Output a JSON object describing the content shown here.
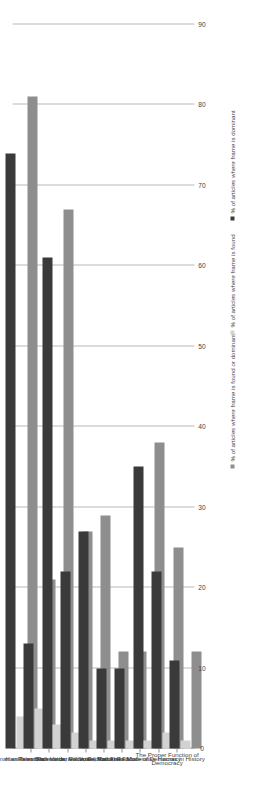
{
  "chart_data": {
    "type": "bar",
    "orientation": "horizontal-rotated",
    "title": "",
    "xlabel": "",
    "ylabel": "",
    "grid": true,
    "legend_position": "bottom",
    "axis_min": 0,
    "axis_max": 90,
    "tick_step": 10,
    "tick_labels": [
      "0",
      "10",
      "20",
      "30",
      "40",
      "50",
      "60",
      "70",
      "80",
      "90"
    ],
    "categories": [
      "Hamas as Terrorists",
      "Hamas as Backwards",
      "Palestinian Voice, Rational",
      "Palestinian Voice, Radical",
      "Israeli Voice, Rational",
      "Israeli Voice, Radical",
      "Hamas as Moderates",
      "The Failure of Democracy",
      "The Proper Function of Democracy",
      "Hamas in History"
    ],
    "series": [
      {
        "name": "% of articles where frame is dominant",
        "color": "#3a3a3a",
        "values": [
          74,
          13,
          61,
          22,
          27,
          10,
          10,
          35,
          22,
          11
        ]
      },
      {
        "name": "% of articles where frame is found",
        "color": "#d2d2d2",
        "values": [
          4,
          5,
          3,
          2,
          1,
          1,
          1,
          1,
          2,
          1
        ]
      },
      {
        "name": "% of articles where frame is found or dominant",
        "color": "#8e8e8e",
        "values": [
          81,
          21,
          67,
          27,
          29,
          12,
          12,
          38,
          25,
          12
        ]
      }
    ]
  },
  "colors": {
    "found_or_dominant": "#8e8e8e",
    "dominant": "#3a3a3a",
    "found": "#d2d2d2",
    "gridline": "#b9b9b9",
    "axis": "#8f8f8f",
    "text": "#3f3f3f",
    "background": "#ffffff"
  }
}
